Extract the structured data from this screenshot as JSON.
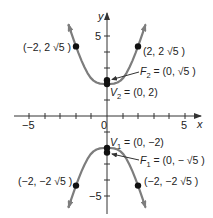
{
  "diagram": {
    "type": "hyperbola",
    "equation": "y^2/4 - x^2 = 1",
    "axes": {
      "x_label": "x",
      "y_label": "y",
      "x_tick_labels": {
        "neg": "−5",
        "origin": "0",
        "pos": "5"
      },
      "y_tick_labels": {
        "pos": "5",
        "neg": "−5"
      },
      "xlim": [
        -5.9,
        6
      ],
      "ylim": [
        -6,
        6.5
      ]
    },
    "colors": {
      "curve": "#7d7d7d",
      "axis": "#333333",
      "point": "#111111",
      "text": "#222222"
    },
    "labels": {
      "upper_left_point": "(−2, 2 √5 )",
      "upper_right_point": "(2, 2 √5 )",
      "focus_upper": {
        "name": "F",
        "sub": "2",
        "value": " = (0, √5 )"
      },
      "vertex_upper": {
        "name": "V",
        "sub": "2",
        "value": " = (0, 2)"
      },
      "vertex_lower": {
        "name": "V",
        "sub": "1",
        "value": " = (0, −2)"
      },
      "focus_lower": {
        "name": "F",
        "sub": "1",
        "value": " = (0, − √5 )"
      },
      "lower_left_point": "(−2, −2 √5 )",
      "lower_right_point": "(−2, −2 √5 )"
    },
    "points": [
      {
        "name": "upper-left",
        "x": -2,
        "y": 4.472
      },
      {
        "name": "upper-right",
        "x": 2,
        "y": 4.472
      },
      {
        "name": "F2",
        "x": 0,
        "y": 2.236
      },
      {
        "name": "V2",
        "x": 0,
        "y": 2
      },
      {
        "name": "V1",
        "x": 0,
        "y": -2
      },
      {
        "name": "F1",
        "x": 0,
        "y": -2.236
      },
      {
        "name": "lower-left",
        "x": -2,
        "y": -4.472
      },
      {
        "name": "lower-right",
        "x": 2,
        "y": -4.472
      }
    ]
  }
}
